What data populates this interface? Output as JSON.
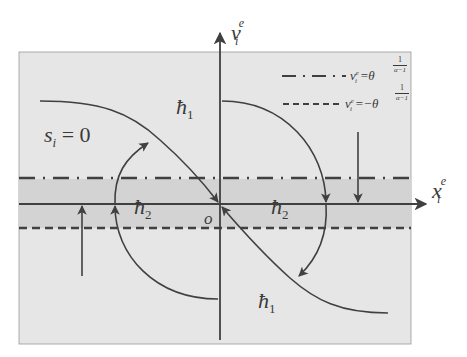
{
  "colors": {
    "panel_fill": "#e6e6e6",
    "band_fill": "#d3d3d3",
    "stroke": "#404040",
    "background": "#ffffff"
  },
  "axes": {
    "x_label": {
      "base": "x",
      "sub": "i",
      "sup": "e"
    },
    "y_label": {
      "base": "v",
      "sub": "i",
      "sup": "e"
    },
    "origin_label": "o"
  },
  "legend": [
    {
      "style": "dash-dot",
      "lhs": "v",
      "lhs_sub": "i",
      "lhs_sup": "e",
      "eq": "=",
      "rhs": "θ",
      "exp_num": "1",
      "exp_den": "α−1"
    },
    {
      "style": "dashed",
      "lhs": "v",
      "lhs_sub": "i",
      "lhs_sup": "e",
      "eq": "=",
      "rhs": "−θ",
      "exp_num": "1",
      "exp_den": "α−1"
    }
  ],
  "annotations": {
    "sliding_surface": {
      "base": "s",
      "sub": "i",
      "rest": " = 0"
    },
    "h1_top": {
      "base": "ħ",
      "sub": "1"
    },
    "h1_bottom": {
      "base": "ħ",
      "sub": "1"
    },
    "h2_left": {
      "base": "ħ",
      "sub": "2"
    },
    "h2_right": {
      "base": "ħ",
      "sub": "2"
    }
  }
}
